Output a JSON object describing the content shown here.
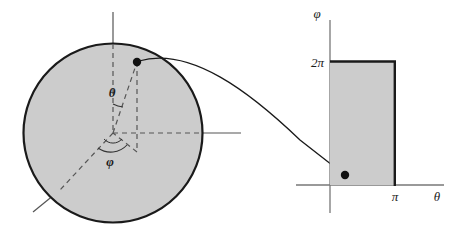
{
  "figure": {
    "colors": {
      "fill_gray": "#cccccc",
      "outline_dark": "#1a1a1a",
      "axis_gray": "#555555",
      "dashed_gray": "#666666",
      "background": "#ffffff"
    }
  },
  "sphere_panel": {
    "name": "sphere-diagram",
    "center": {
      "x": 113,
      "y": 133
    },
    "radius": 90,
    "point_on_surface": {
      "x": 137,
      "y": 62
    },
    "angle_labels": {
      "polar": "θ",
      "azimuthal": "φ"
    }
  },
  "rectangle_panel": {
    "name": "parameter-domain-diagram",
    "origin": {
      "x": 330,
      "y": 185
    },
    "vertical_axis_label": "φ",
    "horizontal_axis_label": "θ",
    "vertical_tick_label": "2π",
    "horizontal_tick_label": "π",
    "domain_point": {
      "x": 345,
      "y": 175
    }
  },
  "mapping_arrow": {
    "name": "mapping-arrow",
    "from": "point-on-sphere",
    "to": "point-in-domain"
  }
}
